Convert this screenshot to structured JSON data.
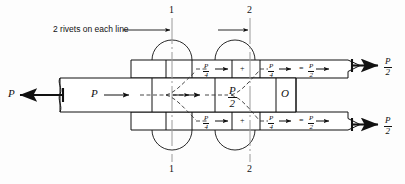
{
  "figure": {
    "type": "engineering-diagram",
    "line_color": "#111111",
    "dash_color": "#333333",
    "centerline_color": "#999999",
    "background": "#fdfdfd"
  },
  "annotations": {
    "note": "2 rivets on each line",
    "section_line_1_top": "1",
    "section_line_1_bottom": "1",
    "section_line_2_top": "2",
    "section_line_2_bottom": "2",
    "origin_label": "O"
  },
  "forces": {
    "left_external": {
      "numerator": "P",
      "denominator": "",
      "whole": "P"
    },
    "plate_internal": {
      "whole": "P"
    },
    "plate_center": {
      "numerator": "P",
      "denominator": "2"
    },
    "upper_strap_first": {
      "numerator": "P",
      "denominator": "4"
    },
    "upper_strap_second": {
      "numerator": "P",
      "denominator": "4"
    },
    "upper_strap_sum": {
      "numerator": "P",
      "denominator": "2"
    },
    "lower_strap_first": {
      "numerator": "P",
      "denominator": "4"
    },
    "lower_strap_second": {
      "numerator": "P",
      "denominator": "4"
    },
    "lower_strap_sum": {
      "numerator": "P",
      "denominator": "2"
    },
    "right_upper_external": {
      "numerator": "P",
      "denominator": "2"
    },
    "right_lower_external": {
      "numerator": "P",
      "denominator": "2"
    },
    "plus_upper": "+",
    "plus_lower": "+",
    "equals_upper": "=",
    "equals_lower": "="
  }
}
